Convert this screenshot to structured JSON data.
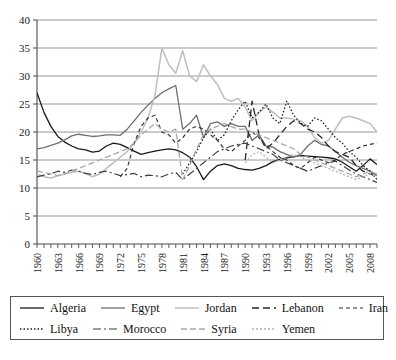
{
  "chart_data": {
    "type": "line",
    "title": "",
    "subtitle": "",
    "xlabel": "",
    "ylabel": "",
    "xlim": [
      1960,
      2009
    ],
    "ylim": [
      0,
      40
    ],
    "ytick_step": 5,
    "yticks": [
      "0",
      "5",
      "10",
      "15",
      "20",
      "25",
      "30",
      "35",
      "40"
    ],
    "xticks": [
      "1960",
      "1963",
      "1966",
      "1969",
      "1972",
      "1975",
      "1978",
      "1981",
      "1984",
      "1987",
      "1990",
      "1993",
      "1996",
      "1999",
      "2002",
      "2005",
      "2008"
    ],
    "grid": "horizontal",
    "legend_position": "bottom",
    "x": [
      1960,
      1961,
      1962,
      1963,
      1964,
      1965,
      1966,
      1967,
      1968,
      1969,
      1970,
      1971,
      1972,
      1973,
      1974,
      1975,
      1976,
      1977,
      1978,
      1979,
      1980,
      1981,
      1982,
      1983,
      1984,
      1985,
      1986,
      1987,
      1988,
      1989,
      1990,
      1991,
      1992,
      1993,
      1994,
      1995,
      1996,
      1997,
      1998,
      1999,
      2000,
      2001,
      2002,
      2003,
      2004,
      2005,
      2006,
      2007,
      2008,
      2009
    ],
    "series": [
      {
        "name": "Algeria",
        "color": "#1a1a1a",
        "dash": "none",
        "width": 1.3,
        "values": [
          27.0,
          23.5,
          21.0,
          19.2,
          18.2,
          17.5,
          17.0,
          16.8,
          16.4,
          16.6,
          17.5,
          18.0,
          17.8,
          17.2,
          16.6,
          16.0,
          16.3,
          16.6,
          16.8,
          17.0,
          16.8,
          16.3,
          15.5,
          13.8,
          11.5,
          13.0,
          14.0,
          14.3,
          14.0,
          13.5,
          13.3,
          13.2,
          13.5,
          14.0,
          14.7,
          15.1,
          15.4,
          15.6,
          15.8,
          15.7,
          15.6,
          15.5,
          15.4,
          15.2,
          14.6,
          13.8,
          13.0,
          14.0,
          15.2,
          14.2
        ]
      },
      {
        "name": "Egypt",
        "color": "#6e6e6e",
        "dash": "none",
        "width": 1.3,
        "values": [
          17.0,
          17.2,
          17.6,
          18.0,
          18.6,
          19.3,
          19.6,
          19.4,
          19.2,
          19.3,
          19.5,
          19.5,
          19.4,
          20.5,
          22.0,
          23.5,
          24.8,
          26.0,
          27.0,
          27.7,
          28.3,
          20.5,
          21.5,
          23.0,
          19.0,
          21.5,
          21.8,
          21.0,
          21.5,
          21.0,
          21.0,
          18.5,
          19.5,
          17.5,
          17.3,
          16.5,
          16.0,
          15.5,
          16.0,
          17.5,
          18.5,
          17.8,
          17.5,
          16.5,
          15.5,
          14.6,
          14.0,
          13.5,
          13.0,
          12.2
        ]
      },
      {
        "name": "Jordan",
        "color": "#bfbfbf",
        "dash": "none",
        "width": 1.5,
        "values": [
          12.5,
          12.0,
          11.8,
          12.2,
          12.5,
          12.8,
          13.0,
          12.6,
          12.0,
          12.5,
          13.5,
          14.5,
          15.5,
          16.5,
          18.0,
          20.0,
          22.5,
          26.5,
          35.0,
          32.0,
          30.5,
          34.5,
          30.0,
          29.0,
          32.0,
          30.0,
          28.5,
          26.0,
          25.5,
          26.0,
          24.5,
          22.0,
          23.5,
          24.5,
          23.5,
          22.5,
          22.5,
          22.3,
          22.0,
          21.0,
          19.0,
          18.0,
          18.5,
          20.5,
          22.5,
          22.8,
          22.5,
          22.0,
          21.5,
          20.0
        ]
      },
      {
        "name": "Lebanon",
        "color": "#262626",
        "dash": "7,4",
        "width": 1.3,
        "values": [
          null,
          null,
          null,
          null,
          null,
          null,
          null,
          null,
          null,
          null,
          null,
          null,
          null,
          null,
          null,
          null,
          null,
          null,
          null,
          null,
          null,
          null,
          null,
          null,
          null,
          null,
          null,
          null,
          null,
          null,
          15.0,
          25.5,
          19.5,
          17.0,
          18.0,
          19.5,
          21.0,
          22.0,
          21.5,
          20.5,
          20.0,
          19.0,
          17.5,
          16.5,
          16.0,
          15.5,
          14.0,
          13.0,
          12.5,
          12.0
        ]
      },
      {
        "name": "Iran",
        "color": "#333333",
        "dash": "4,3",
        "width": 1.2,
        "values": [
          null,
          null,
          null,
          null,
          null,
          null,
          null,
          null,
          null,
          null,
          null,
          null,
          12.0,
          13.5,
          18.0,
          21.0,
          22.5,
          23.0,
          20.0,
          19.5,
          18.0,
          19.0,
          20.5,
          21.0,
          20.5,
          19.5,
          18.5,
          17.0,
          16.5,
          17.5,
          18.5,
          20.0,
          19.0,
          17.5,
          16.5,
          15.5,
          15.0,
          14.0,
          13.5,
          14.5,
          15.5,
          15.0,
          14.5,
          15.0,
          16.0,
          16.5,
          17.0,
          17.5,
          17.8,
          18.0
        ]
      },
      {
        "name": "Libya",
        "color": "#1f1f1f",
        "dash": "1.5,2",
        "width": 1.3,
        "values": [
          null,
          null,
          null,
          null,
          null,
          null,
          null,
          null,
          null,
          null,
          null,
          null,
          null,
          null,
          null,
          null,
          null,
          null,
          null,
          null,
          null,
          12.5,
          14.5,
          16.5,
          19.0,
          20.5,
          18.5,
          19.5,
          22.0,
          24.0,
          25.5,
          22.5,
          23.5,
          25.0,
          22.5,
          21.5,
          25.5,
          23.0,
          21.5,
          21.0,
          22.5,
          22.0,
          20.5,
          19.0,
          18.0,
          16.5,
          15.5,
          14.0,
          13.0,
          11.5
        ]
      },
      {
        "name": "Morocco",
        "color": "#404040",
        "dash": "8,3,2,3",
        "width": 1.2,
        "values": [
          12.0,
          12.3,
          12.5,
          13.0,
          12.8,
          13.2,
          13.0,
          12.6,
          12.4,
          12.8,
          13.0,
          12.6,
          12.2,
          12.4,
          12.6,
          12.0,
          12.3,
          12.2,
          12.0,
          12.5,
          12.8,
          11.5,
          12.5,
          13.5,
          14.5,
          15.5,
          16.5,
          17.0,
          17.5,
          17.8,
          18.0,
          17.5,
          17.0,
          16.5,
          16.0,
          15.0,
          14.5,
          14.0,
          13.5,
          13.0,
          13.5,
          14.0,
          14.5,
          14.8,
          14.0,
          13.2,
          12.5,
          12.0,
          11.5,
          11.0
        ]
      },
      {
        "name": "Syria",
        "color": "#a8a8a8",
        "dash": "6,3",
        "width": 1.3,
        "values": [
          13.0,
          12.8,
          12.5,
          12.2,
          12.5,
          13.0,
          13.5,
          14.0,
          14.5,
          15.0,
          15.5,
          16.0,
          16.5,
          17.0,
          18.0,
          19.5,
          20.5,
          21.5,
          20.5,
          20.0,
          20.5,
          11.5,
          14.0,
          17.0,
          19.5,
          20.5,
          21.0,
          21.5,
          21.0,
          20.5,
          20.5,
          20.0,
          19.5,
          19.0,
          18.5,
          18.0,
          17.5,
          17.0,
          16.0,
          15.5,
          15.0,
          14.5,
          14.0,
          13.5,
          13.0,
          12.5,
          12.0,
          12.5,
          13.0,
          12.5
        ]
      },
      {
        "name": "Yemen",
        "color": "#b5b5b5",
        "dash": "2,2",
        "width": 1.3,
        "values": [
          null,
          null,
          null,
          null,
          null,
          null,
          null,
          null,
          null,
          null,
          null,
          null,
          null,
          null,
          null,
          null,
          null,
          null,
          null,
          null,
          null,
          null,
          null,
          null,
          null,
          null,
          null,
          null,
          null,
          null,
          14.5,
          16.0,
          16.5,
          15.5,
          14.5,
          15.0,
          15.5,
          16.0,
          15.5,
          15.0,
          14.5,
          14.0,
          13.5,
          13.0,
          12.5,
          12.0,
          11.5,
          12.0,
          12.5,
          12.0
        ]
      }
    ]
  },
  "legend": {
    "rows": [
      [
        "Algeria",
        "Egypt",
        "Jordan",
        "Lebanon",
        "Iran"
      ],
      [
        "Libya",
        "Morocco",
        "Syria",
        "Yemen"
      ]
    ]
  }
}
